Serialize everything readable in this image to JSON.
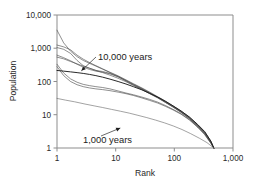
{
  "chart_data": {
    "type": "line",
    "title": "",
    "subtitle": "",
    "xlabel": "Rank",
    "ylabel": "Population",
    "xscale": "log",
    "yscale": "log",
    "xlim": [
      1,
      1000
    ],
    "ylim": [
      1,
      10000
    ],
    "grid": false,
    "legend": "none",
    "xticklabels": [
      "1",
      "10",
      "100",
      "1,000"
    ],
    "xtickvalues": [
      1,
      10,
      100,
      1000
    ],
    "yticklabels": [
      "1",
      "10",
      "100",
      "1,000",
      "10,000"
    ],
    "ytickvalues": [
      1,
      10,
      100,
      1000,
      10000
    ],
    "annotations": [
      {
        "text": "10,000 years",
        "points_to": "bundle of rank-size curves at 10,000 years",
        "x": 2.6,
        "y": 210
      },
      {
        "text": "1,000 years",
        "points_to": "lowest rank-size curve at 1,000 years",
        "x": 12,
        "y": 4.0
      }
    ],
    "series": [
      {
        "name": "10,000 years run 1",
        "style": "thin-grey",
        "x": [
          1,
          1.3,
          1.7,
          2.2,
          2.8,
          3.6,
          4.6,
          6,
          8,
          11,
          15,
          20,
          28,
          38,
          52,
          70,
          95,
          130,
          180,
          250,
          330,
          420,
          470
        ],
        "y": [
          3500,
          1450,
          820,
          560,
          430,
          350,
          290,
          235,
          185,
          142,
          108,
          83,
          62,
          46,
          34,
          25,
          18,
          12.5,
          8.2,
          4.8,
          2.9,
          1.5,
          1
        ]
      },
      {
        "name": "10,000 years run 2",
        "style": "thin-grey",
        "x": [
          1,
          1.3,
          1.7,
          2.2,
          2.8,
          3.6,
          4.6,
          6,
          8,
          11,
          15,
          20,
          28,
          38,
          52,
          70,
          95,
          130,
          180,
          250,
          330,
          420,
          470
        ],
        "y": [
          1250,
          1100,
          900,
          620,
          470,
          370,
          300,
          240,
          190,
          148,
          112,
          86,
          64,
          48,
          35,
          26,
          18.5,
          13,
          8.5,
          5.0,
          3.0,
          1.6,
          1
        ]
      },
      {
        "name": "10,000 years run 3",
        "style": "thin-grey",
        "x": [
          1,
          1.3,
          1.7,
          2.2,
          2.8,
          3.6,
          4.6,
          6,
          8,
          11,
          15,
          20,
          28,
          38,
          52,
          70,
          95,
          130,
          180,
          250,
          330,
          420,
          470
        ],
        "y": [
          1050,
          930,
          700,
          430,
          300,
          250,
          215,
          200,
          175,
          140,
          105,
          80,
          60,
          45,
          33,
          24,
          17.5,
          12.2,
          8.0,
          4.7,
          2.8,
          1.5,
          1
        ]
      },
      {
        "name": "10,000 years run 4",
        "style": "thin-grey",
        "x": [
          1,
          1.3,
          1.7,
          2.2,
          2.8,
          3.6,
          4.6,
          6,
          8,
          11,
          15,
          20,
          28,
          38,
          52,
          70,
          95,
          130,
          180,
          250,
          330,
          420,
          470
        ],
        "y": [
          620,
          520,
          420,
          330,
          270,
          230,
          205,
          190,
          170,
          138,
          104,
          80,
          59,
          44,
          33,
          24,
          17.2,
          12.0,
          7.8,
          4.6,
          2.8,
          1.5,
          1
        ]
      },
      {
        "name": "10,000 years run 5",
        "style": "thin-grey",
        "x": [
          1,
          1.3,
          1.7,
          2.2,
          2.8,
          3.6,
          4.6,
          6,
          8,
          11,
          15,
          20,
          28,
          38,
          52,
          70,
          95,
          130,
          180,
          250,
          330,
          420,
          470
        ],
        "y": [
          540,
          480,
          400,
          340,
          290,
          250,
          215,
          185,
          155,
          125,
          98,
          76,
          57,
          43,
          32,
          23.5,
          17,
          11.8,
          7.7,
          4.5,
          2.7,
          1.45,
          1
        ]
      },
      {
        "name": "10,000 years run 6",
        "style": "thin-grey",
        "x": [
          1,
          1.3,
          1.7,
          2.2,
          2.8,
          3.6,
          4.6,
          6,
          8,
          11,
          15,
          20,
          28,
          38,
          52,
          70,
          95,
          130,
          180,
          250,
          330,
          420,
          470
        ],
        "y": [
          330,
          180,
          120,
          95,
          82,
          75,
          70,
          66,
          60,
          52,
          45,
          40,
          34,
          29,
          24,
          19,
          14.5,
          10.8,
          7.2,
          4.3,
          2.6,
          1.4,
          1
        ]
      },
      {
        "name": "10,000 years run 7",
        "style": "thin-grey",
        "x": [
          1,
          1.3,
          1.7,
          2.2,
          2.8,
          3.6,
          4.6,
          6,
          8,
          11,
          15,
          20,
          28,
          38,
          52,
          70,
          95,
          130,
          180,
          250,
          330,
          420,
          470
        ],
        "y": [
          280,
          150,
          100,
          80,
          70,
          64,
          60,
          57,
          53,
          48,
          43,
          38,
          32,
          27,
          22.5,
          18,
          14,
          10.4,
          7.0,
          4.2,
          2.5,
          1.38,
          1
        ]
      },
      {
        "name": "10,000 years mean (dark)",
        "style": "thick-dark",
        "x": [
          1,
          1.3,
          1.7,
          2.2,
          2.8,
          3.6,
          4.6,
          6,
          8,
          11,
          15,
          20,
          28,
          38,
          52,
          70,
          95,
          130,
          180,
          250,
          330,
          420,
          470
        ],
        "y": [
          215,
          205,
          195,
          185,
          175,
          163,
          150,
          135,
          118,
          100,
          84,
          70,
          56,
          44,
          34,
          25.5,
          18.5,
          13,
          8.6,
          5.1,
          3.1,
          1.6,
          1
        ]
      },
      {
        "name": "1,000 years",
        "style": "thin-low",
        "x": [
          1,
          1.4,
          2,
          3,
          4.3,
          6,
          8.5,
          12,
          17,
          24,
          34,
          48,
          68,
          96,
          135,
          190,
          270,
          360,
          440,
          470
        ],
        "y": [
          31,
          27.5,
          24.5,
          21,
          18.5,
          16.5,
          14.5,
          12.8,
          11.2,
          9.6,
          8.2,
          6.9,
          5.7,
          4.6,
          3.6,
          2.7,
          1.95,
          1.45,
          1.1,
          1
        ]
      }
    ]
  },
  "axes": {
    "x_title": "Rank",
    "y_title": "Population"
  },
  "colors": {
    "frame": "#8d8d8d",
    "curve_light": "#4a4a4a",
    "curve_dark": "#1d1d1d",
    "text": "#2a2a2a",
    "background": "#ffffff"
  }
}
